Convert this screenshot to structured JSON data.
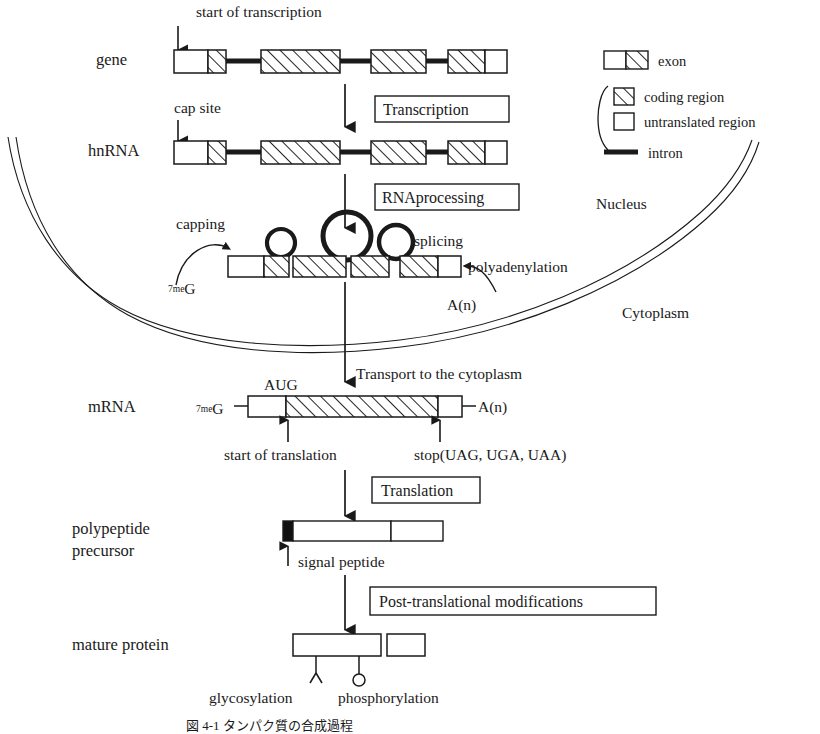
{
  "figure": {
    "caption": "図 4-1  タンパク質の合成過程",
    "compartments": {
      "nucleus": "Nucleus",
      "cytoplasm": "Cytoplasm"
    }
  },
  "rows": {
    "gene": "gene",
    "hnrna": "hnRNA",
    "mrna": "mRNA",
    "polypeptide_line1": "polypeptide",
    "polypeptide_line2": "precursor",
    "mature_protein": "mature protein"
  },
  "process_boxes": {
    "transcription": "Transcription",
    "rna_processing": "RNAprocessing",
    "translation": "Translation",
    "post_translational": "Post-translational modifications"
  },
  "annotations": {
    "start_of_transcription": "start of transcription",
    "cap_site": "cap site",
    "capping": "capping",
    "splicing": "splicing",
    "polyadenylation": "polyadenylation",
    "transport": "Transport to the cytoplasm",
    "start_codon": "AUG",
    "start_of_translation": "start of translation",
    "stop_codons": "stop(UAG, UGA, UAA)",
    "signal_peptide": "signal peptide",
    "glycosylation": "glycosylation",
    "phosphorylation": "phosphorylation",
    "cap_g_sup": "7me",
    "cap_g_base": "G",
    "polya_tail": "A(n)",
    "polya_tail_mrna": "A(n)"
  },
  "legend": {
    "items": [
      {
        "key": "exon",
        "label": "exon"
      },
      {
        "key": "coding-region",
        "label": "coding region"
      },
      {
        "key": "untranslated-region",
        "label": "untranslated region"
      },
      {
        "key": "intron",
        "label": "intron"
      }
    ]
  },
  "colors": {
    "ink": "#1a1a1a",
    "paper": "#ffffff",
    "hatch": "#1a1a1a",
    "signal_peptide_fill": "#111111"
  },
  "structures": {
    "gene": {
      "exons": [
        {
          "untranslated": 58,
          "coding": 22
        },
        {
          "untranslated": 0,
          "coding": 72
        },
        {
          "untranslated": 0,
          "coding": 52
        },
        {
          "untranslated": 26,
          "coding": 44
        }
      ],
      "introns": [
        54,
        54,
        42
      ]
    },
    "hnrna": {
      "exons": [
        {
          "untranslated": 58,
          "coding": 22
        },
        {
          "untranslated": 0,
          "coding": 72
        },
        {
          "untranslated": 0,
          "coding": 52
        },
        {
          "untranslated": 26,
          "coding": 44
        }
      ],
      "introns": [
        54,
        54,
        42
      ]
    },
    "spliced": {
      "segments": [
        {
          "type": "untranslated",
          "width": 52
        },
        {
          "type": "coding",
          "width": 34
        },
        {
          "type": "coding",
          "width": 72
        },
        {
          "type": "coding",
          "width": 50
        },
        {
          "type": "coding",
          "width": 50
        },
        {
          "type": "untranslated",
          "width": 28
        }
      ],
      "loops": [
        {
          "r": 14
        },
        {
          "r": 24
        },
        {
          "r": 17
        }
      ]
    },
    "mrna": {
      "untranslated_5": 56,
      "coding": 152,
      "untranslated_3": 26
    },
    "polypeptide": {
      "signal_peptide": 12,
      "segment_a": 98,
      "segment_b": 56
    },
    "mature_protein": {
      "main": 90,
      "cleaved": 38
    }
  }
}
